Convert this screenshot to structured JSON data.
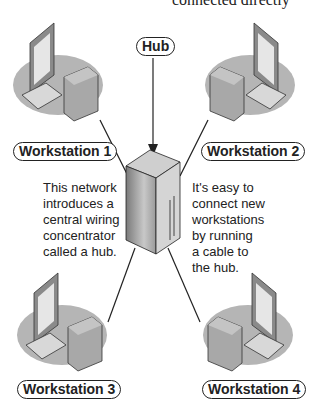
{
  "top_caption": "connected directly",
  "hub": {
    "label": "Hub"
  },
  "workstations": [
    {
      "label": "Workstation 1"
    },
    {
      "label": "Workstation 2"
    },
    {
      "label": "Workstation 3"
    },
    {
      "label": "Workstation 4"
    }
  ],
  "captions": {
    "left": [
      "This network",
      "introduces a",
      "central wiring",
      "concentrator",
      "called a hub."
    ],
    "right": [
      "It's easy to",
      "connect new",
      "workstations",
      "by running",
      "a cable to",
      "the hub."
    ]
  },
  "colors": {
    "line": "#222222",
    "shadow": "#b8b8b8",
    "device": "#9a9a9a"
  }
}
